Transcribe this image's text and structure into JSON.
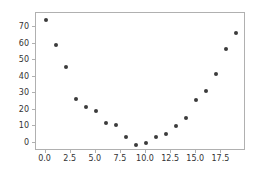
{
  "chart_data": {
    "type": "scatter",
    "title": "",
    "xlabel": "",
    "ylabel": "",
    "x": [
      0,
      1,
      2,
      3,
      4,
      5,
      6,
      7,
      8,
      9,
      10,
      11,
      12,
      13,
      14,
      15,
      16,
      17,
      18,
      19
    ],
    "values": [
      74.8,
      59.4,
      45.8,
      26.6,
      21.5,
      19.4,
      12.3,
      10.8,
      3.6,
      -1.2,
      -0.4,
      3.2,
      5.1,
      10.1,
      15.3,
      26.0,
      31.7,
      42.0,
      57.0,
      66.6
    ],
    "series": [
      {
        "name": "points",
        "values": [
          74.8,
          59.4,
          45.8,
          26.6,
          21.5,
          19.4,
          12.3,
          10.8,
          3.6,
          -1.2,
          -0.4,
          3.2,
          5.1,
          10.1,
          15.3,
          26.0,
          31.7,
          42.0,
          57.0,
          66.6
        ]
      }
    ],
    "xlim": [
      -0.95,
      19.95
    ],
    "ylim": [
      -5.0,
      78.8
    ],
    "xticks": [
      0.0,
      2.5,
      5.0,
      7.5,
      10.0,
      12.5,
      15.0,
      17.5
    ],
    "yticks": [
      0,
      10,
      20,
      30,
      40,
      50,
      60,
      70
    ],
    "xticklabels": [
      "0.0",
      "2.5",
      "5.0",
      "7.5",
      "10.0",
      "12.5",
      "15.0",
      "17.5"
    ],
    "yticklabels": [
      "0",
      "10",
      "20",
      "30",
      "40",
      "50",
      "60",
      "70"
    ],
    "grid": false,
    "legend": false,
    "marker_color": "#3b3b3b",
    "marker_size": 4,
    "axes_color": "#b0b0b0",
    "background_color": "#ffffff"
  }
}
